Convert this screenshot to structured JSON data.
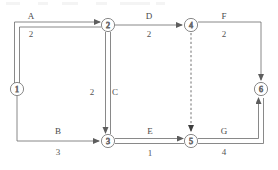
{
  "diagram": {
    "type": "activity-on-arrow-network",
    "title": "",
    "nodes": [
      {
        "id": "1",
        "label": "1",
        "x": 17,
        "y": 89
      },
      {
        "id": "2",
        "label": "2",
        "x": 108,
        "y": 25
      },
      {
        "id": "3",
        "label": "3",
        "x": 108,
        "y": 141
      },
      {
        "id": "4",
        "label": "4",
        "x": 191,
        "y": 25
      },
      {
        "id": "5",
        "label": "5",
        "x": 191,
        "y": 141
      },
      {
        "id": "6",
        "label": "6",
        "x": 261,
        "y": 89
      }
    ],
    "activities": [
      {
        "name": "A",
        "duration": "2",
        "from": "1",
        "to": "2",
        "critical": true,
        "dummy": false,
        "name_x": 31,
        "name_y": 16,
        "dur_x": 31,
        "dur_y": 34
      },
      {
        "name": "B",
        "duration": "3",
        "from": "1",
        "to": "3",
        "critical": false,
        "dummy": false,
        "name_x": 58,
        "name_y": 131,
        "dur_x": 58,
        "dur_y": 152
      },
      {
        "name": "C",
        "duration": "2",
        "from": "2",
        "to": "3",
        "critical": true,
        "dummy": false,
        "name_x": 115,
        "name_y": 92,
        "dur_x": 92,
        "dur_y": 92
      },
      {
        "name": "D",
        "duration": "2",
        "from": "2",
        "to": "4",
        "critical": false,
        "dummy": false,
        "name_x": 149,
        "name_y": 16,
        "dur_x": 149,
        "dur_y": 34
      },
      {
        "name": "E",
        "duration": "1",
        "from": "3",
        "to": "5",
        "critical": true,
        "dummy": false,
        "name_x": 150,
        "name_y": 131,
        "dur_x": 150,
        "dur_y": 153
      },
      {
        "name": "F",
        "duration": "2",
        "from": "4",
        "to": "6",
        "critical": false,
        "dummy": false,
        "name_x": 224,
        "name_y": 16,
        "dur_x": 224,
        "dur_y": 34
      },
      {
        "name": "G",
        "duration": "4",
        "from": "5",
        "to": "6",
        "critical": true,
        "dummy": false,
        "name_x": 224,
        "name_y": 131,
        "dur_x": 224,
        "dur_y": 152
      },
      {
        "name": "",
        "duration": "",
        "from": "4",
        "to": "5",
        "critical": false,
        "dummy": true,
        "name_x": 0,
        "name_y": 0,
        "dur_x": 0,
        "dur_y": 0
      }
    ],
    "critical_path": [
      "1",
      "2",
      "3",
      "5",
      "6"
    ],
    "colors": {
      "line": "#6b6b6b",
      "text": "#4a4a4a",
      "node_stroke": "#6b6b6b",
      "background": "#ffffff",
      "dummy": "#4d4d4d"
    }
  }
}
